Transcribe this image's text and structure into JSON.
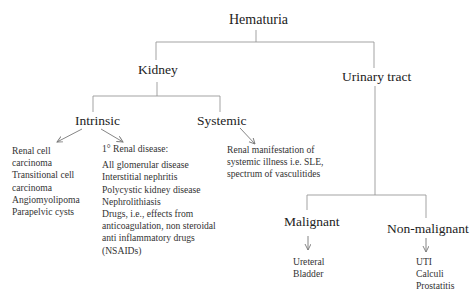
{
  "diagram": {
    "root": "Hematuria",
    "level1": {
      "kidney": "Kidney",
      "urinary_tract": "Urinary tract"
    },
    "kidney_children": {
      "intrinsic": "Intrinsic",
      "systemic": "Systemic"
    },
    "intrinsic_children": {
      "tumors": [
        "Renal cell",
        "carcinoma",
        "Transitional cell",
        "carcinoma",
        "Angiomyolipoma",
        "Parapelvic cysts"
      ],
      "renal_disease_heading": "1° Renal disease:",
      "renal_disease": [
        "All glomerular disease",
        "Interstitial nephritis",
        "Polycystic kidney disease",
        "Nephrolithiasis",
        "Drugs, i.e., effects from",
        "anticoagulation, non steroidal",
        "anti inflammatory drugs",
        "(NSAIDs)"
      ]
    },
    "systemic_children": [
      "Renal manifestation of",
      "systemic illness i.e. SLE,",
      "spectrum of vasculitides"
    ],
    "urinary_children": {
      "malignant": "Malignant",
      "non_malignant": "Non-malignant"
    },
    "malignant_items": [
      "Ureteral",
      "Bladder"
    ],
    "non_malignant_items": [
      "UTI",
      "Calculi",
      "Prostatitis"
    ]
  }
}
